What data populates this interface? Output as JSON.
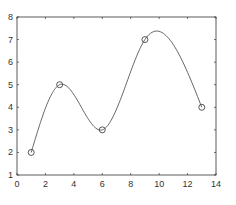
{
  "chart_data": {
    "type": "line",
    "title": "",
    "xlabel": "",
    "ylabel": "",
    "xlim": [
      0,
      14
    ],
    "ylim": [
      1,
      8
    ],
    "grid": false,
    "legend": null,
    "x_ticks": [
      0,
      2,
      4,
      6,
      8,
      10,
      12,
      14
    ],
    "y_ticks": [
      1,
      2,
      3,
      4,
      5,
      6,
      7,
      8
    ],
    "series": [
      {
        "name": "data",
        "marker": "circle",
        "line": "spline",
        "x": [
          1,
          3,
          6,
          9,
          13
        ],
        "y": [
          2,
          5,
          3,
          7,
          4
        ]
      }
    ],
    "annotations": []
  },
  "style": {
    "axis_color": "#333333",
    "line_color": "#555555",
    "marker_color": "#444444",
    "background": "#ffffff"
  }
}
